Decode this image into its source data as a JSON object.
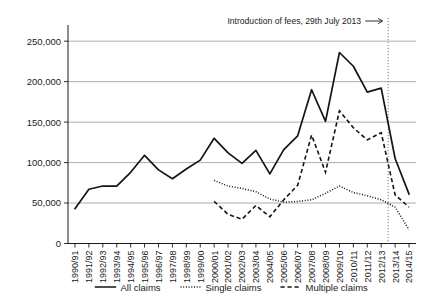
{
  "chart_data": {
    "type": "line",
    "title": "",
    "xlabel": "",
    "ylabel": "",
    "ylim": [
      0,
      270000
    ],
    "yticks": [
      0,
      50000,
      100000,
      150000,
      200000,
      250000
    ],
    "ytick_labels": [
      "0",
      "50,000",
      "100,000",
      "150,000",
      "200,000",
      "250,000"
    ],
    "grid": true,
    "legend_position": "bottom",
    "categories": [
      "1990/91",
      "1991/92",
      "1992/93",
      "1993/94",
      "1994/95",
      "1995/96",
      "1996/97",
      "1997/98",
      "1998/99",
      "1999/00",
      "2000/01",
      "2001/02",
      "2002/03",
      "2003/04",
      "2004/05",
      "2005/06",
      "2006/07",
      "2007/08",
      "2008/09",
      "2009/10",
      "2010/11",
      "2011/12",
      "2012/13",
      "2013/14",
      "2014/15"
    ],
    "series": [
      {
        "name": "All claims",
        "style": "solid",
        "values": [
          43000,
          67000,
          71000,
          71000,
          88000,
          109000,
          91000,
          80000,
          92000,
          103000,
          130000,
          112000,
          99000,
          115000,
          86000,
          116000,
          133000,
          190000,
          151000,
          236000,
          219000,
          187000,
          192000,
          105000,
          61000
        ]
      },
      {
        "name": "Single claims",
        "style": "dotted",
        "values": [
          null,
          null,
          null,
          null,
          null,
          null,
          null,
          null,
          null,
          null,
          78000,
          71000,
          68000,
          64000,
          55000,
          51000,
          52000,
          54000,
          62000,
          71000,
          63000,
          59000,
          54000,
          45000,
          17000
        ]
      },
      {
        "name": "Multiple claims",
        "style": "dashed",
        "values": [
          null,
          null,
          null,
          null,
          null,
          null,
          null,
          null,
          null,
          null,
          52000,
          36000,
          30000,
          47000,
          33000,
          54000,
          72000,
          134000,
          88000,
          164000,
          143000,
          128000,
          137000,
          60000,
          45000
        ]
      }
    ],
    "annotations": [
      {
        "name": "fee-introduction",
        "text": "Introduction of fees, 29th July 2013",
        "arrow": "→",
        "at_category": "2012/13",
        "line_style": "dotted-vertical"
      }
    ],
    "legend": [
      {
        "label": "All claims",
        "style": "solid"
      },
      {
        "label": "Single claims",
        "style": "dotted"
      },
      {
        "label": "Multiple claims",
        "style": "dashed"
      }
    ]
  }
}
